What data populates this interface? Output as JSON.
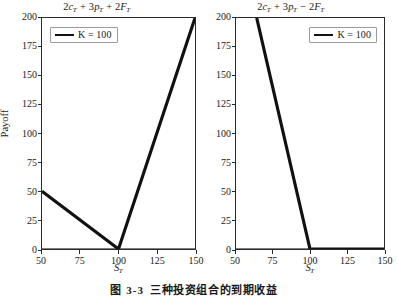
{
  "chart_data": [
    {
      "type": "line",
      "panel": "left",
      "title": "2c_T + 3p_T + 2F_T",
      "title_parts": {
        "c_coef": "2",
        "c_sym": "c",
        "c_sub": "T",
        "op1": "+",
        "p_coef": "3",
        "p_sym": "p",
        "p_sub": "T",
        "op2": "+",
        "f_coef": "2",
        "f_sym": "F",
        "f_sub": "T"
      },
      "xlabel": "S_T",
      "xlabel_sym": "S",
      "xlabel_sub": "T",
      "ylabel": "Payoff",
      "xlim": [
        50,
        150
      ],
      "ylim": [
        0,
        200
      ],
      "xticks": [
        50,
        75,
        100,
        125,
        150
      ],
      "yticks": [
        0,
        25,
        50,
        75,
        100,
        125,
        150,
        175,
        200
      ],
      "grid": false,
      "legend": {
        "position": "upper left",
        "entries": [
          "K = 100"
        ]
      },
      "series": [
        {
          "name": "K = 100",
          "color": "#111111",
          "linewidth": 3.2,
          "x": [
            50,
            100,
            150
          ],
          "y": [
            50,
            0,
            200
          ]
        },
        {
          "name": "zero-line",
          "color": "#555555",
          "linewidth": 1.6,
          "x": [
            50,
            150
          ],
          "y": [
            0,
            0
          ]
        }
      ]
    },
    {
      "type": "line",
      "panel": "right",
      "title": "2c_T + 3p_T - 2F_T",
      "title_parts": {
        "c_coef": "2",
        "c_sym": "c",
        "c_sub": "T",
        "op1": "+",
        "p_coef": "3",
        "p_sym": "p",
        "p_sub": "T",
        "op2": "−",
        "f_coef": "2",
        "f_sym": "F",
        "f_sub": "T"
      },
      "xlabel": "S_T",
      "xlabel_sym": "S",
      "xlabel_sub": "T",
      "ylabel": "",
      "xlim": [
        50,
        150
      ],
      "ylim": [
        0,
        200
      ],
      "xticks": [
        50,
        75,
        100,
        125,
        150
      ],
      "yticks": [
        0,
        25,
        50,
        75,
        100,
        125,
        150,
        175,
        200
      ],
      "grid": false,
      "legend": {
        "position": "upper right",
        "entries": [
          "K = 100"
        ]
      },
      "series": [
        {
          "name": "K = 100",
          "color": "#111111",
          "linewidth": 3.2,
          "x": [
            64,
            100,
            150
          ],
          "y": [
            200,
            0,
            0
          ]
        },
        {
          "name": "zero-line",
          "color": "#555555",
          "linewidth": 1.6,
          "x": [
            50,
            150
          ],
          "y": [
            0,
            0
          ]
        }
      ]
    }
  ],
  "caption": {
    "number": "图 3-3",
    "text": "三种投资组合的到期收益"
  },
  "colors": {
    "line": "#111111",
    "zero_line": "#555555",
    "axis": "#2a2a2a",
    "background": "#ffffff",
    "legend_border": "#9a9a9a"
  }
}
